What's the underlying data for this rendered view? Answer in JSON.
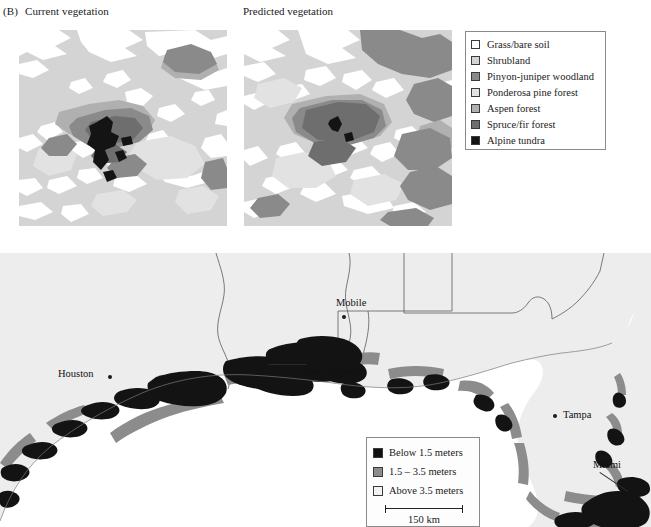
{
  "figure": {
    "panel_tag": "(B)",
    "current_title": "Current vegetation",
    "predicted_title": "Predicted vegetation"
  },
  "vegetation_legend": {
    "items": [
      {
        "label": "Grass/bare soil",
        "color": "#ffffff"
      },
      {
        "label": "Shrubland",
        "color": "#d4d4d4"
      },
      {
        "label": "Pinyon-juniper woodland",
        "color": "#8a8a8a"
      },
      {
        "label": "Ponderosa pine forest",
        "color": "#e2e2e2"
      },
      {
        "label": "Aspen forest",
        "color": "#b0b0b0"
      },
      {
        "label": "Spruce/fir forest",
        "color": "#6e6e6e"
      },
      {
        "label": "Alpine tundra",
        "color": "#141414"
      }
    ]
  },
  "map": {
    "cities": [
      {
        "name": "Houston",
        "label_x": 58,
        "label_y": 368,
        "dot_x": 108,
        "dot_y": 375
      },
      {
        "name": "Mobile",
        "label_x": 336,
        "label_y": 297,
        "dot_x": 342,
        "dot_y": 315
      },
      {
        "name": "New Orleans",
        "label_x": 305,
        "label_y": 366,
        "dot_x": 289,
        "dot_y": 367
      },
      {
        "name": "Tampa",
        "label_x": 563,
        "label_y": 409,
        "dot_x": 556,
        "dot_y": 415
      },
      {
        "name": "Miami",
        "label_x": 593,
        "label_y": 459,
        "dot_x": 620,
        "dot_y": 487
      }
    ],
    "legend": {
      "items": [
        {
          "label": "Below 1.5 meters",
          "color": "#111111"
        },
        {
          "label": "1.5 – 3.5 meters",
          "color": "#8c8c8c"
        },
        {
          "label": "Above 3.5 meters",
          "color": "#f2f2f2"
        }
      ],
      "scale_label": "150 km"
    }
  },
  "colors": {
    "land": "#ededed",
    "ocean": "#ffffff",
    "border_line": "#555555",
    "legend_border": "#8a8a8a"
  }
}
